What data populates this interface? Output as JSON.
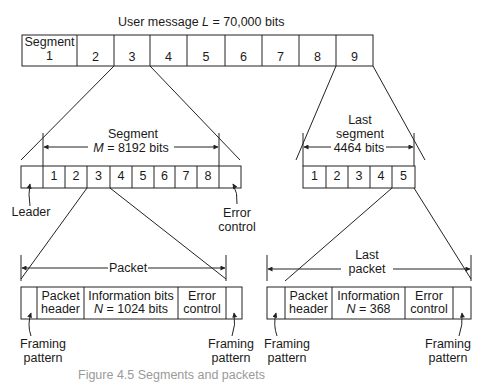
{
  "title": "User message L = 70,000 bits",
  "title_parts": {
    "pre": "User message ",
    "var": "L",
    "post": " = 70,000 bits"
  },
  "user_message": {
    "segments": [
      {
        "label_top": "Segment",
        "label": "1"
      },
      {
        "label": "2"
      },
      {
        "label": "3"
      },
      {
        "label": "4"
      },
      {
        "label": "5"
      },
      {
        "label": "6"
      },
      {
        "label": "7"
      },
      {
        "label": "8"
      },
      {
        "label": "9"
      }
    ]
  },
  "segment": {
    "dim_label_line1": "Segment",
    "dim_var": "M",
    "dim_label_line2": " = 8192 bits",
    "packets": [
      "",
      "1",
      "2",
      "3",
      "4",
      "5",
      "6",
      "7",
      "8",
      ""
    ],
    "leader_label": "Leader",
    "error_label_line1": "Error",
    "error_label_line2": "control"
  },
  "last_segment": {
    "dim_label_line1": "Last",
    "dim_label_line2": "segment",
    "dim_label_line3": "4464 bits",
    "packets": [
      "1",
      "2",
      "3",
      "4",
      "5"
    ]
  },
  "packet": {
    "dim_label": "Packet",
    "fields": [
      {
        "line1": "",
        "line2": ""
      },
      {
        "line1": "Packet",
        "line2": "header"
      },
      {
        "line1": "Information bits",
        "line2_var": "N",
        "line2": " = 1024 bits"
      },
      {
        "line1": "Error",
        "line2": "control"
      },
      {
        "line1": "",
        "line2": ""
      }
    ],
    "framing_left": [
      "Framing",
      "pattern"
    ],
    "framing_right": [
      "Framing",
      "pattern"
    ]
  },
  "last_packet": {
    "dim_label_line1": "Last",
    "dim_label_line2": "packet",
    "fields": [
      {
        "line1": "",
        "line2": ""
      },
      {
        "line1": "Packet",
        "line2": "header"
      },
      {
        "line1": "Information",
        "line2_var": "N",
        "line2": " = 368"
      },
      {
        "line1": "Error",
        "line2": "control"
      },
      {
        "line1": "",
        "line2": ""
      }
    ],
    "framing_left": [
      "Framing",
      "pattern"
    ],
    "framing_right": [
      "Framing",
      "pattern"
    ]
  },
  "caption": "Figure 4.5   Segments and packets",
  "colors": {
    "line": "#222222",
    "text": "#1a1a1a",
    "background": "#ffffff"
  }
}
